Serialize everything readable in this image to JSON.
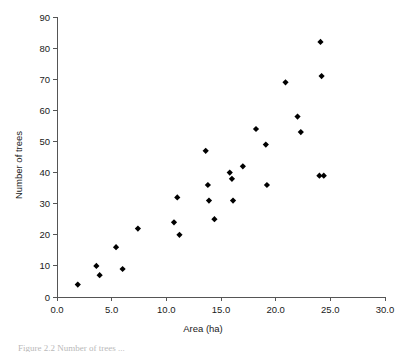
{
  "figure": {
    "caption": "Figure 2.2  Number of trees ..."
  },
  "chart_data": {
    "type": "scatter",
    "title": "",
    "xlabel": "Area (ha)",
    "ylabel": "Number of trees",
    "xlim": [
      0,
      30
    ],
    "ylim": [
      0,
      90
    ],
    "xticks": [
      "0.0",
      "5.0",
      "10.0",
      "15.0",
      "20.0",
      "25.0",
      "30.0"
    ],
    "xtick_values": [
      0,
      5,
      10,
      15,
      20,
      25,
      30
    ],
    "yticks": [
      "0",
      "10",
      "20",
      "30",
      "40",
      "50",
      "60",
      "70",
      "80",
      "90"
    ],
    "ytick_values": [
      0,
      10,
      20,
      30,
      40,
      50,
      60,
      70,
      80,
      90
    ],
    "grid": false,
    "legend": null,
    "marker": "diamond",
    "marker_color": "#000000",
    "points": [
      {
        "x": 1.9,
        "y": 4
      },
      {
        "x": 3.6,
        "y": 10
      },
      {
        "x": 3.9,
        "y": 7
      },
      {
        "x": 5.4,
        "y": 16
      },
      {
        "x": 6.0,
        "y": 9
      },
      {
        "x": 7.4,
        "y": 22
      },
      {
        "x": 10.7,
        "y": 24
      },
      {
        "x": 11.0,
        "y": 32
      },
      {
        "x": 11.2,
        "y": 20
      },
      {
        "x": 13.6,
        "y": 47
      },
      {
        "x": 13.8,
        "y": 36
      },
      {
        "x": 13.9,
        "y": 31
      },
      {
        "x": 14.4,
        "y": 25
      },
      {
        "x": 15.8,
        "y": 40
      },
      {
        "x": 16.0,
        "y": 38
      },
      {
        "x": 16.1,
        "y": 31
      },
      {
        "x": 17.0,
        "y": 42
      },
      {
        "x": 18.2,
        "y": 54
      },
      {
        "x": 19.1,
        "y": 49
      },
      {
        "x": 19.2,
        "y": 36
      },
      {
        "x": 20.9,
        "y": 69
      },
      {
        "x": 22.0,
        "y": 58
      },
      {
        "x": 22.3,
        "y": 53
      },
      {
        "x": 24.0,
        "y": 39
      },
      {
        "x": 24.1,
        "y": 82
      },
      {
        "x": 24.2,
        "y": 71
      },
      {
        "x": 24.4,
        "y": 39
      }
    ]
  }
}
